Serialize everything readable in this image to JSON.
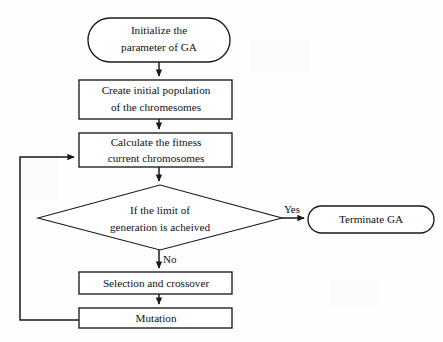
{
  "diagram": {
    "type": "flowchart",
    "width": 443,
    "height": 342,
    "background_color": "#fefefe",
    "stroke_color": "#1a1a1a",
    "text_color": "#111111"
  },
  "nodes": [
    {
      "id": "initialize",
      "shape": "stadium",
      "line1": "Initialize the",
      "line2": "parameter of GA",
      "x": 88,
      "y": 18,
      "w": 142,
      "h": 44
    },
    {
      "id": "create-population",
      "shape": "rectangle",
      "line1": "Create initial population",
      "line2": "of the chromesomes",
      "x": 79,
      "y": 80,
      "w": 153,
      "h": 39
    },
    {
      "id": "calculate-fitness",
      "shape": "rectangle",
      "line1": "Calculate the fitness",
      "line2": "current chromosomes",
      "x": 79,
      "y": 133,
      "w": 153,
      "h": 34
    },
    {
      "id": "limit-check",
      "shape": "diamond",
      "line1": "If the limit of",
      "line2": "generation is acheived",
      "x": 38,
      "y": 185,
      "w": 244,
      "h": 65
    },
    {
      "id": "terminate",
      "shape": "stadium",
      "line1": "Terminate GA",
      "line2": "",
      "x": 308,
      "y": 206,
      "w": 126,
      "h": 27
    },
    {
      "id": "selection-crossover",
      "shape": "rectangle",
      "line1": "Selection and crossover",
      "line2": "",
      "x": 79,
      "y": 272,
      "w": 153,
      "h": 22
    },
    {
      "id": "mutation",
      "shape": "rectangle",
      "line1": "Mutation",
      "line2": "",
      "x": 79,
      "y": 308,
      "w": 153,
      "h": 20
    }
  ],
  "edge_labels": {
    "yes": "Yes",
    "no": "No"
  }
}
